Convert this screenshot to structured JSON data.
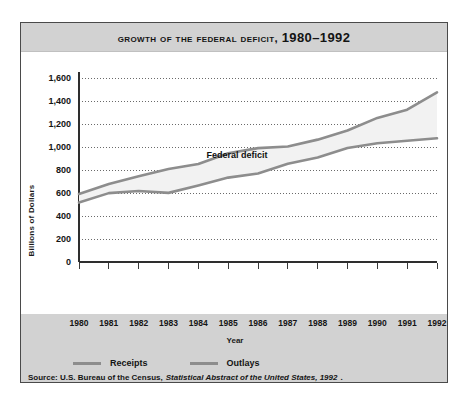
{
  "figure": {
    "title_main": "Growth of the Federal Deficit, ",
    "title_years": "1980–1992",
    "annotation": "Federal deficit",
    "source_prefix": "Source: U.S. Bureau of the Census,",
    "source_italic": "Statistical Abstract of the United States, 1992",
    "source_suffix": "."
  },
  "legend": {
    "position": "bottom-left",
    "items": [
      {
        "label": "Receipts",
        "color": "#8d8d8d"
      },
      {
        "label": "Outlays",
        "color": "#8d8d8d"
      }
    ]
  },
  "axes": {
    "x_title": "Year",
    "y_title": "Billions of Dollars",
    "y_ticks": [
      "0",
      "200",
      "400",
      "600",
      "800",
      "1,000",
      "1,200",
      "1,400",
      "1,600"
    ],
    "x_ticks": [
      "1980",
      "1981",
      "1982",
      "1983",
      "1984",
      "1985",
      "1986",
      "1987",
      "1988",
      "1989",
      "1990",
      "1991",
      "1992"
    ]
  },
  "chart_data": {
    "type": "line",
    "xlabel": "Year",
    "ylabel": "Billions of Dollars",
    "xlim": [
      1980,
      1992
    ],
    "ylim": [
      0,
      1600
    ],
    "grid": "horizontal-dotted",
    "legend_position": "bottom-left",
    "annotations": [
      {
        "text": "Federal deficit",
        "x": 1985.3,
        "y": 905
      }
    ],
    "x": [
      1980,
      1981,
      1982,
      1983,
      1984,
      1985,
      1986,
      1987,
      1988,
      1989,
      1990,
      1991,
      1992
    ],
    "series": [
      {
        "name": "Receipts",
        "color": "#8d8d8d",
        "values": [
          517,
          599,
          618,
          601,
          666,
          734,
          769,
          854,
          909,
          991,
          1032,
          1055,
          1076
        ]
      },
      {
        "name": "Outlays",
        "color": "#8d8d8d",
        "values": [
          591,
          678,
          746,
          808,
          852,
          946,
          990,
          1004,
          1064,
          1143,
          1253,
          1324,
          1475
        ]
      }
    ],
    "shaded_region": {
      "label": "Federal deficit",
      "between": [
        "Receipts",
        "Outlays"
      ],
      "fill": "#f2f2f2"
    }
  }
}
